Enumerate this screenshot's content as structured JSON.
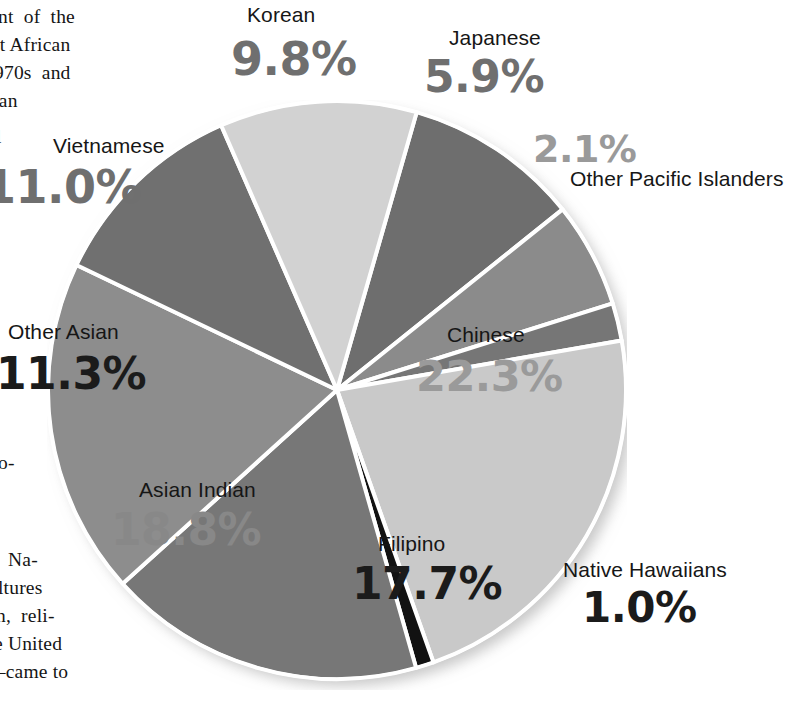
{
  "page": {
    "type": "scanned-book-page-with-pie-chart",
    "background_color": "#ffffff"
  },
  "body_text": {
    "lines": [
      "nt  of  the",
      "st African",
      "970s  and",
      "can",
      "l",
      "oo-",
      "Na-",
      "ultures",
      "on,  reli-",
      "he United",
      "—came to"
    ]
  },
  "chart_data": {
    "type": "pie",
    "title": "",
    "subtitle": "",
    "xlabel": "",
    "ylabel": "",
    "legend_position": "none",
    "labels_inline": true,
    "value_suffix": "%",
    "categories": [
      "Korean",
      "Japanese",
      "Other Pacific Islanders",
      "Chinese",
      "Native Hawaiians",
      "Filipino",
      "Asian Indian",
      "Other Asian",
      "Vietnamese"
    ],
    "values": [
      9.8,
      5.9,
      2.1,
      22.3,
      1.0,
      17.7,
      18.8,
      11.3,
      11.0
    ],
    "value_labels": [
      "9.8%",
      "5.9%",
      "2.1%",
      "22.3%",
      "1.0%",
      "17.7%",
      "18.8%",
      "11.3%",
      "11.0%"
    ],
    "colors": [
      "#6e6e6e",
      "#8b8b8b",
      "#767676",
      "#c9c9c9",
      "#121212",
      "#777777",
      "#8d8d8d",
      "#707070",
      "#d2d2d2"
    ],
    "slice_border_color": "#ffffff",
    "total": 99.9,
    "start_angle_deg": -74,
    "direction": "clockwise"
  },
  "slices": [
    {
      "name": "Korean",
      "label": "Korean",
      "pct": "9.8%",
      "color": "#6e6e6e",
      "pct_tone": "pct-mid"
    },
    {
      "name": "Japanese",
      "label": "Japanese",
      "pct": "5.9%",
      "color": "#8b8b8b",
      "pct_tone": "pct-mid"
    },
    {
      "name": "Other Pacific Islanders",
      "label": "Other Pacific Islanders",
      "pct": "2.1%",
      "color": "#767676",
      "pct_tone": "pct-lt"
    },
    {
      "name": "Chinese",
      "label": "Chinese",
      "pct": "22.3%",
      "color": "#c9c9c9",
      "pct_tone": "pct-lt"
    },
    {
      "name": "Native Hawaiians",
      "label": "Native Hawaiians",
      "pct": "1.0%",
      "color": "#121212",
      "pct_tone": "pct-dark"
    },
    {
      "name": "Filipino",
      "label": "Filipino",
      "pct": "17.7%",
      "color": "#777777",
      "pct_tone": "pct-dark"
    },
    {
      "name": "Asian Indian",
      "label": "Asian Indian",
      "pct": "18.8%",
      "color": "#8d8d8d",
      "pct_tone": "pct-midlt"
    },
    {
      "name": "Other Asian",
      "label": "Other Asian",
      "pct": "11.3%",
      "color": "#707070",
      "pct_tone": "pct-dark"
    },
    {
      "name": "Vietnamese",
      "label": "Vietnamese",
      "pct": "11.0%",
      "color": "#d2d2d2",
      "pct_tone": "pct-mid"
    }
  ]
}
